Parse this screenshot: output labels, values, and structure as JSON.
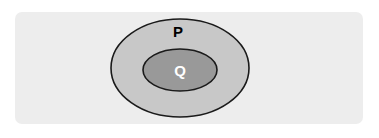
{
  "diagram": {
    "type": "euler-diagram",
    "title": "",
    "canvas": {
      "width": 379,
      "height": 138,
      "background_color": "#ffffff"
    },
    "panel": {
      "name": "diagram-background-panel",
      "color": "#ededed",
      "x": 15,
      "y": 12,
      "width": 348,
      "height": 112,
      "corner_radius": 7
    },
    "sets": [
      {
        "id": "outer",
        "label": "P",
        "label_color": "#000000",
        "fill_color": "#c8c8c8",
        "stroke_color": "#1a1a1a",
        "shape": "ellipse",
        "center_x": 180,
        "center_y": 68,
        "radius_x": 69,
        "radius_y": 49,
        "label_x": 178,
        "label_y": 31
      },
      {
        "id": "inner",
        "label": "Q",
        "label_color": "#ffffff",
        "fill_color": "#999999",
        "stroke_color": "#1a1a1a",
        "shape": "ellipse",
        "center_x": 180,
        "center_y": 70,
        "radius_x": 37,
        "radius_y": 21,
        "label_x": 180,
        "label_y": 70
      }
    ],
    "relationship": "Q is a subset of P"
  }
}
